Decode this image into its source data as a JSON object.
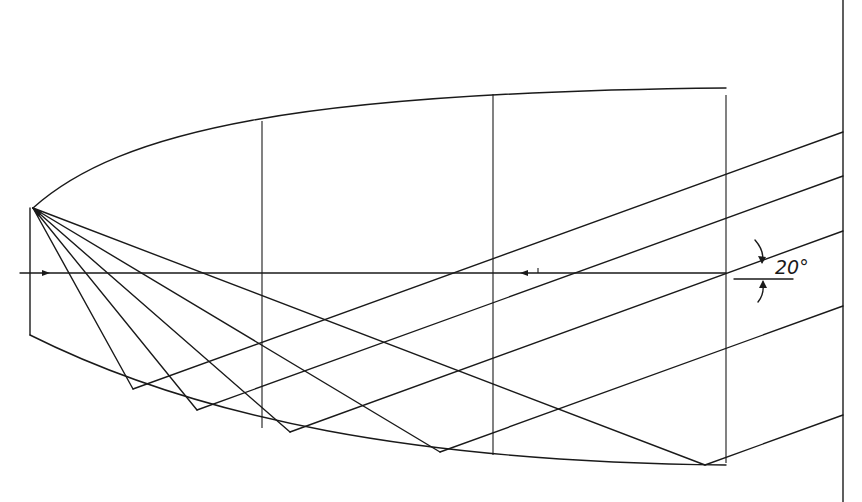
{
  "diagram": {
    "type": "reflector-ray-diagram",
    "angle_label": "20°",
    "stroke_color": "#1a1a1a",
    "background": "#ffffff",
    "focus": {
      "x": 33,
      "y": 208
    },
    "axis": {
      "y": 273,
      "x_start": 20,
      "x_end": 726
    },
    "verticals": [
      262,
      493,
      726
    ],
    "right_wall_x": 843,
    "rays": [
      {
        "reflect": [
          133,
          389
        ],
        "wall_y": 132
      },
      {
        "reflect": [
          197,
          410
        ],
        "wall_y": 176
      },
      {
        "reflect": [
          290,
          432
        ],
        "wall_y": 231
      },
      {
        "reflect": [
          440,
          452
        ],
        "wall_y": 306
      },
      {
        "reflect": [
          705,
          465
        ],
        "wall_y": 415
      }
    ]
  }
}
